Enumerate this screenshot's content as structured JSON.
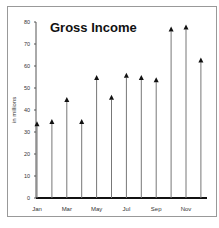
{
  "chart_data": {
    "type": "bar",
    "subtype": "stem-with-arrow-markers",
    "title": "Gross Income",
    "xlabel": "",
    "ylabel": "in millions",
    "categories": [
      "Jan",
      "Feb",
      "Mar",
      "Apr",
      "May",
      "Jun",
      "Jul",
      "Aug",
      "Sep",
      "Oct",
      "Nov",
      "Dec"
    ],
    "x_tick_labels": [
      "Jan",
      "Mar",
      "May",
      "Jul",
      "Sep",
      "Nov"
    ],
    "y_ticks": [
      0,
      10,
      20,
      30,
      40,
      50,
      60,
      70,
      80
    ],
    "values": [
      34,
      35,
      45,
      35,
      55,
      46,
      56,
      55,
      54,
      77,
      78,
      63
    ],
    "ylim": [
      0,
      80
    ],
    "grid": false,
    "legend": null
  }
}
